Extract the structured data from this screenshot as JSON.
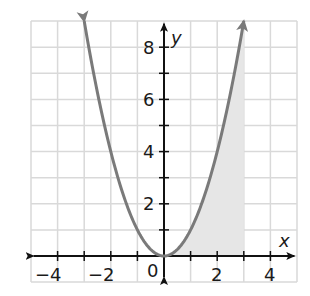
{
  "chart_data": {
    "type": "line",
    "title": "",
    "xlabel": "x",
    "ylabel": "y",
    "xlim": [
      -5,
      5
    ],
    "ylim": [
      -1,
      9
    ],
    "grid": true,
    "x_ticks": [
      -4,
      -2,
      0,
      2,
      4
    ],
    "x_tick_labels": [
      "−4",
      "−2",
      "0",
      "2",
      "4"
    ],
    "y_ticks": [
      2,
      4,
      6,
      8
    ],
    "y_tick_labels": [
      "2",
      "4",
      "6",
      "8"
    ],
    "series": [
      {
        "name": "y = x^2",
        "function": "x^2",
        "x": [
          -3,
          -2.5,
          -2,
          -1.5,
          -1,
          -0.5,
          0,
          0.5,
          1,
          1.5,
          2,
          2.5,
          3
        ],
        "values": [
          9,
          6.25,
          4,
          2.25,
          1,
          0.25,
          0,
          0.25,
          1,
          2.25,
          4,
          6.25,
          9
        ],
        "color": "#7a7a7a",
        "arrows_at_ends": true
      }
    ],
    "shaded_region": {
      "description": "area under curve y = x^2 from x = 0 to x = 3",
      "x_from": 0,
      "x_to": 3,
      "color": "#e6e6e6"
    }
  },
  "labels": {
    "x_axis": "x",
    "y_axis": "y",
    "origin": "0",
    "x_ticks": [
      "−4",
      "−2",
      "2",
      "4"
    ],
    "y_ticks": [
      "2",
      "4",
      "6",
      "8"
    ]
  },
  "colors": {
    "curve": "#7a7a7a",
    "shade": "#e6e6e6",
    "grid": "#d9d9d9",
    "axis": "#111111"
  }
}
